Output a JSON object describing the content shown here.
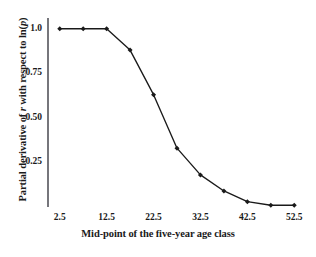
{
  "chart_data": {
    "type": "line",
    "title": "",
    "xlabel": "Mid-point of the five-year age class",
    "ylabel": "Partial derivative of r with respect to ln(p)",
    "ylabel_parts": {
      "prefix": "Partial derivative of ",
      "italic_r": "r",
      "middle": " with respect to  ln(",
      "italic_p": "p",
      "suffix": ")"
    },
    "x": [
      2.5,
      7.5,
      12.5,
      17.5,
      22.5,
      27.5,
      32.5,
      37.5,
      42.5,
      47.5,
      52.5
    ],
    "values": [
      1.0,
      1.0,
      1.0,
      0.88,
      0.63,
      0.33,
      0.18,
      0.09,
      0.03,
      0.01,
      0.01
    ],
    "series": [
      {
        "name": "Partial derivative",
        "values": [
          1.0,
          1.0,
          1.0,
          0.88,
          0.63,
          0.33,
          0.18,
          0.09,
          0.03,
          0.01,
          0.01
        ]
      }
    ],
    "xlim": [
      0.0,
      55.0
    ],
    "ylim": [
      0.0,
      1.06
    ],
    "xticks": [
      2.5,
      12.5,
      22.5,
      32.5,
      42.5,
      52.5
    ],
    "xtick_labels": [
      "2.5",
      "12.5",
      "22.5",
      "32.5",
      "42.5",
      "52.5"
    ],
    "yticks": [
      0.25,
      0.5,
      0.75,
      1.0
    ],
    "ytick_labels": [
      "0.25",
      "0.50",
      "0.75",
      "1.0"
    ],
    "grid": false,
    "legend": "none",
    "marker": "diamond",
    "line_color": "#1a1a1a",
    "marker_color": "#1a1a1a",
    "axis_color": "#4a4a52",
    "background_color": "#ffffff"
  }
}
